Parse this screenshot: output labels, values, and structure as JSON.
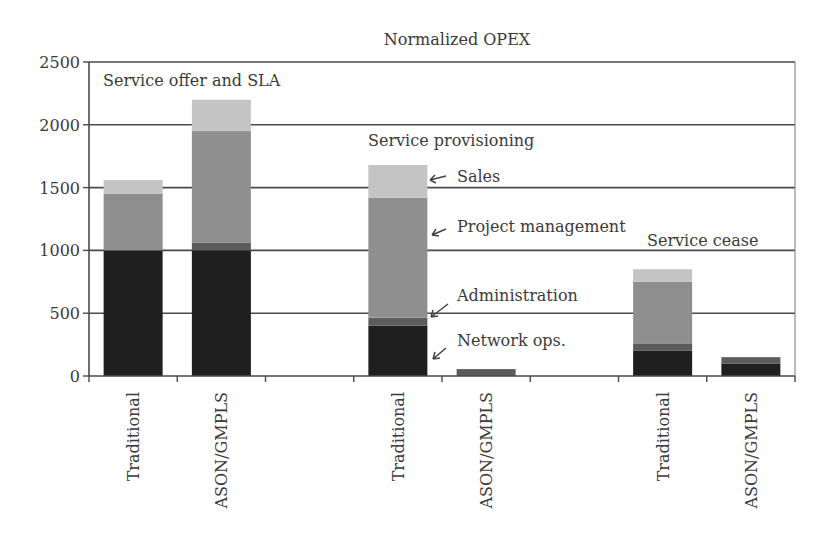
{
  "chart_data": {
    "type": "bar",
    "stacked": true,
    "title": "Normalized OPEX",
    "xlabel": "",
    "ylabel": "",
    "ylim": [
      0,
      2500
    ],
    "yticks": [
      0,
      500,
      1000,
      1500,
      2000,
      2500
    ],
    "grid": true,
    "legend_position": "inline annotations (arrows)",
    "groups": [
      {
        "label": "Service offer and SLA",
        "categories": [
          "Traditional",
          "ASON/GMPLS"
        ]
      },
      {
        "label": "Service provisioning",
        "categories": [
          "Traditional",
          "ASON/GMPLS"
        ]
      },
      {
        "label": "Service cease",
        "categories": [
          "Traditional",
          "ASON/GMPLS"
        ]
      }
    ],
    "categories": [
      "Traditional",
      "ASON/GMPLS",
      "",
      "Traditional",
      "ASON/GMPLS",
      "",
      "Traditional",
      "ASON/GMPLS"
    ],
    "series": [
      {
        "name": "Network ops.",
        "color": "#1f1f1f",
        "values": [
          1000,
          1000,
          null,
          400,
          0,
          null,
          200,
          100
        ]
      },
      {
        "name": "Administration",
        "color": "#5c5c5c",
        "values": [
          0,
          60,
          null,
          65,
          55,
          null,
          55,
          50
        ]
      },
      {
        "name": "Project management",
        "color": "#8f8f8f",
        "values": [
          450,
          890,
          null,
          955,
          0,
          null,
          495,
          0
        ]
      },
      {
        "name": "Sales",
        "color": "#c4c4c4",
        "values": [
          110,
          250,
          null,
          260,
          0,
          null,
          100,
          0
        ]
      }
    ],
    "annotations": [
      {
        "text": "Sales",
        "points_to": "Sales segment of Service provisioning / Traditional"
      },
      {
        "text": "Project management",
        "points_to": "Project management segment of Service provisioning / Traditional"
      },
      {
        "text": "Administration",
        "points_to": "Administration segment of Service provisioning / Traditional"
      },
      {
        "text": "Network ops.",
        "points_to": "Network ops. segment of Service provisioning / Traditional"
      }
    ]
  },
  "labels": {
    "title": "Normalized OPEX",
    "group_sla": "Service offer and SLA",
    "group_provisioning": "Service provisioning",
    "group_cease": "Service cease",
    "annot_sales": "Sales",
    "annot_pm": "Project management",
    "annot_admin": "Administration",
    "annot_netops": "Network ops."
  }
}
